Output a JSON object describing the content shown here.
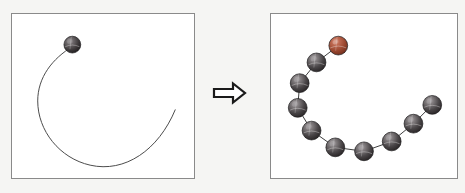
{
  "figure": {
    "title": "Coarse-grained chain reconstruction from a smooth curve",
    "background_color": "#f5f5f3",
    "width": 465,
    "height": 193
  },
  "arrow": {
    "name": "transformation-arrow",
    "glyph": "⇨",
    "direction": "right",
    "outline_color": "#1a1a1a",
    "fill_color": "#ffffff",
    "label": ""
  },
  "panels": [
    {
      "id": "left",
      "name": "source-curve-panel",
      "caption": "",
      "border_color": "#8a8a8a",
      "background_color": "#ffffff",
      "curve": {
        "name": "open-spiral-curve",
        "stroke_color": "#4a4a4a",
        "stroke_width": 1,
        "path": "M 61 33 C 41 45 26 64 26 88 C 26 118 48 146 79 153 C 114 161 148 138 165 97"
      },
      "beads": [
        {
          "id": "L1",
          "label": "terminal-bead",
          "cx": 61,
          "cy": 31,
          "r": 8.5,
          "color": "#3a3638",
          "highlight": "#8d898b",
          "type": "dark"
        }
      ]
    },
    {
      "id": "right",
      "name": "coarse-grained-chain-panel",
      "caption": "",
      "border_color": "#8a8a8a",
      "background_color": "#ffffff",
      "chain": {
        "name": "bead-chain-bonds",
        "stroke_color": "#3c3c3c",
        "stroke_width": 1
      },
      "beads": [
        {
          "id": "R1",
          "label": "head-bead",
          "cx": 68,
          "cy": 32,
          "r": 9.5,
          "color": "#a24d3a",
          "highlight": "#d8a090",
          "type": "red"
        },
        {
          "id": "R2",
          "label": "bead-2",
          "cx": 46,
          "cy": 49,
          "r": 9.5,
          "color": "#45413f",
          "highlight": "#9b9799",
          "type": "dark"
        },
        {
          "id": "R3",
          "label": "bead-3",
          "cx": 29,
          "cy": 70,
          "r": 9.5,
          "color": "#45413f",
          "highlight": "#9b9799",
          "type": "dark"
        },
        {
          "id": "R4",
          "label": "bead-4",
          "cx": 27,
          "cy": 95,
          "r": 9.5,
          "color": "#45413f",
          "highlight": "#9b9799",
          "type": "dark"
        },
        {
          "id": "R5",
          "label": "bead-5",
          "cx": 41,
          "cy": 118,
          "r": 9.5,
          "color": "#45413f",
          "highlight": "#9b9799",
          "type": "dark"
        },
        {
          "id": "R6",
          "label": "bead-6",
          "cx": 65,
          "cy": 135,
          "r": 9.5,
          "color": "#45413f",
          "highlight": "#9b9799",
          "type": "dark"
        },
        {
          "id": "R7",
          "label": "bead-7",
          "cx": 94,
          "cy": 139,
          "r": 9.5,
          "color": "#45413f",
          "highlight": "#9b9799",
          "type": "dark"
        },
        {
          "id": "R8",
          "label": "bead-8",
          "cx": 122,
          "cy": 129,
          "r": 9.5,
          "color": "#45413f",
          "highlight": "#9b9799",
          "type": "dark"
        },
        {
          "id": "R9",
          "label": "bead-9",
          "cx": 144,
          "cy": 111,
          "r": 9.5,
          "color": "#45413f",
          "highlight": "#9b9799",
          "type": "dark"
        },
        {
          "id": "R10",
          "label": "tail-bead",
          "cx": 163,
          "cy": 92,
          "r": 9.5,
          "color": "#45413f",
          "highlight": "#9b9799",
          "type": "dark"
        }
      ]
    }
  ]
}
